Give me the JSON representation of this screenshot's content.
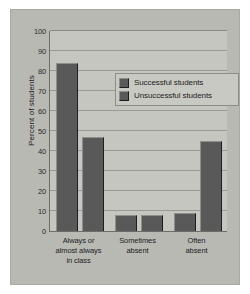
{
  "chart_data": {
    "type": "bar",
    "title": "",
    "xlabel": "",
    "ylabel": "Percent of students",
    "ylim": [
      0,
      100
    ],
    "yticks": [
      0,
      10,
      20,
      30,
      40,
      50,
      60,
      70,
      80,
      90,
      100
    ],
    "grid": true,
    "legend_position": "inside-upper-right",
    "categories": [
      "Always or almost always in class",
      "Sometimes absent",
      "Often absent"
    ],
    "category_lines": [
      [
        "Always or",
        "almost always",
        "in class"
      ],
      [
        "Sometimes",
        "absent"
      ],
      [
        "Often",
        "absent"
      ]
    ],
    "series": [
      {
        "name": "Successful students",
        "values": [
          84,
          8,
          9
        ],
        "color": "#59595a"
      },
      {
        "name": "Unsuccessful students",
        "values": [
          47,
          8,
          45
        ],
        "color": "#59595a"
      }
    ]
  },
  "colors": {
    "card_background": "#b9b9b4",
    "plot_background": "#c6c6c1",
    "bar": "#59595a",
    "gridline": "#9a9a95",
    "axis": "#6e6e69",
    "text": "#1d1d1d"
  }
}
